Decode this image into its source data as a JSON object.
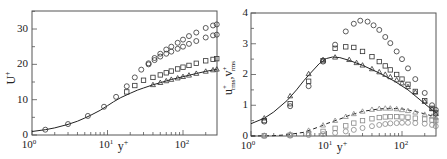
{
  "chart_data": [
    {
      "type": "scatter",
      "title": "",
      "xlabel": "y+",
      "ylabel": "U+",
      "xscale": "log",
      "xlim": [
        1,
        280
      ],
      "ylim": [
        0,
        35
      ],
      "xticks": [
        "10^0",
        "10^1",
        "10^2"
      ],
      "yticks": [
        0,
        10,
        20,
        30
      ],
      "grid": false,
      "series": [
        {
          "name": "reference line (solid)",
          "marker": "line",
          "x": [
            1,
            1.5,
            2,
            3,
            4,
            5,
            6,
            8,
            10,
            12,
            15,
            20,
            25,
            30,
            40,
            50,
            70,
            100,
            150,
            200,
            280
          ],
          "y": [
            1.0,
            1.5,
            2.0,
            3.0,
            3.9,
            4.8,
            5.6,
            7.0,
            8.3,
            9.4,
            10.6,
            11.8,
            12.7,
            13.3,
            14.2,
            14.8,
            15.7,
            16.5,
            17.4,
            18.0,
            18.6
          ]
        },
        {
          "name": "circles (upper)",
          "marker": "circle",
          "x": [
            1.5,
            3,
            5.5,
            9,
            13,
            18,
            23,
            28,
            35,
            42,
            50,
            60,
            70,
            85,
            100,
            120,
            150,
            200,
            250,
            280
          ],
          "y": [
            1.5,
            3.1,
            5.4,
            8.0,
            10.8,
            13.8,
            16.3,
            18.5,
            20.3,
            21.8,
            23.0,
            24.2,
            25.0,
            26.1,
            27.0,
            28.0,
            29.0,
            30.3,
            31.0,
            31.3
          ]
        },
        {
          "name": "circles (second)",
          "marker": "circle",
          "x": [
            35,
            42,
            50,
            60,
            70,
            85,
            100,
            120,
            150,
            200,
            250,
            280
          ],
          "y": [
            20.0,
            21.2,
            22.2,
            23.0,
            23.6,
            24.4,
            25.0,
            25.8,
            26.6,
            27.6,
            28.2,
            28.4
          ]
        },
        {
          "name": "squares",
          "marker": "square",
          "x": [
            18,
            23,
            30,
            40,
            50,
            60,
            70,
            85,
            100,
            120,
            150,
            200,
            250,
            280
          ],
          "y": [
            12.2,
            14.0,
            15.5,
            16.3,
            17.0,
            17.6,
            18.1,
            18.7,
            19.2,
            19.7,
            20.3,
            21.0,
            21.4,
            21.6
          ]
        },
        {
          "name": "triangles",
          "marker": "triangle",
          "x": [
            40,
            50,
            60,
            70,
            85,
            100,
            120,
            150,
            200,
            250,
            280
          ],
          "y": [
            14.2,
            14.8,
            15.3,
            15.7,
            16.1,
            16.5,
            16.9,
            17.4,
            18.0,
            18.4,
            18.6
          ]
        }
      ]
    },
    {
      "type": "scatter",
      "title": "",
      "xlabel": "y+",
      "ylabel": "u+rms, v+rms",
      "xscale": "log",
      "xlim": [
        1,
        280
      ],
      "ylim": [
        0,
        4
      ],
      "xticks": [
        "10^0",
        "10^1",
        "10^2"
      ],
      "yticks": [
        0,
        1,
        2,
        3,
        4
      ],
      "grid": false,
      "series": [
        {
          "name": "u_rms reference (solid)",
          "marker": "line",
          "x": [
            1,
            1.5,
            2,
            3,
            4,
            5,
            6,
            8,
            10,
            12,
            15,
            20,
            30,
            50,
            80,
            120,
            200,
            280
          ],
          "y": [
            0.4,
            0.58,
            0.78,
            1.15,
            1.5,
            1.8,
            2.02,
            2.35,
            2.52,
            2.57,
            2.55,
            2.46,
            2.3,
            2.05,
            1.78,
            1.5,
            1.05,
            0.75
          ]
        },
        {
          "name": "u_rms circles",
          "marker": "circle",
          "x": [
            1.5,
            3.3,
            5.8,
            9,
            13,
            18,
            23,
            28,
            35,
            42,
            50,
            60,
            70,
            85,
            100,
            120,
            150,
            200,
            250,
            280
          ],
          "y": [
            0.47,
            0.97,
            1.62,
            2.42,
            2.97,
            3.4,
            3.65,
            3.75,
            3.72,
            3.6,
            3.45,
            3.22,
            3.02,
            2.75,
            2.5,
            2.2,
            1.85,
            1.4,
            1.0,
            0.85
          ]
        },
        {
          "name": "u_rms squares",
          "marker": "square",
          "x": [
            1.5,
            3.3,
            5.8,
            9,
            13,
            18,
            23,
            30,
            40,
            50,
            60,
            70,
            85,
            100,
            120,
            150,
            200,
            250,
            280
          ],
          "y": [
            0.5,
            1.05,
            1.78,
            2.45,
            2.85,
            2.9,
            2.88,
            2.75,
            2.58,
            2.42,
            2.28,
            2.15,
            2.0,
            1.85,
            1.68,
            1.45,
            1.15,
            0.9,
            0.75
          ]
        },
        {
          "name": "u_rms triangles",
          "marker": "triangle",
          "x": [
            1.5,
            3.3,
            5.8,
            9,
            13,
            20,
            25,
            30,
            40,
            50,
            60,
            70,
            85,
            100,
            120,
            150,
            200,
            250,
            280
          ],
          "y": [
            0.58,
            1.3,
            2.02,
            2.48,
            2.56,
            2.48,
            2.38,
            2.3,
            2.18,
            2.08,
            2.0,
            1.92,
            1.82,
            1.72,
            1.6,
            1.42,
            1.12,
            0.88,
            0.72
          ]
        },
        {
          "name": "v_rms reference (dashed)",
          "marker": "dashed-line",
          "x": [
            1,
            2,
            3,
            5,
            8,
            10,
            15,
            20,
            30,
            50,
            70,
            100,
            150,
            200,
            280
          ],
          "y": [
            0.0,
            0.01,
            0.04,
            0.12,
            0.3,
            0.4,
            0.55,
            0.67,
            0.8,
            0.88,
            0.9,
            0.88,
            0.8,
            0.72,
            0.62
          ]
        },
        {
          "name": "v_rms triangles",
          "marker": "triangle",
          "x": [
            1.5,
            3.3,
            5.8,
            9,
            13,
            18,
            23,
            30,
            40,
            50,
            60,
            70,
            85,
            100,
            120,
            150,
            200,
            250,
            280
          ],
          "y": [
            0.02,
            0.06,
            0.18,
            0.35,
            0.5,
            0.63,
            0.72,
            0.8,
            0.86,
            0.89,
            0.9,
            0.9,
            0.88,
            0.85,
            0.82,
            0.77,
            0.7,
            0.64,
            0.6
          ]
        },
        {
          "name": "v_rms squares",
          "marker": "square",
          "x": [
            1.5,
            3.3,
            5.8,
            9,
            13,
            18,
            23,
            30,
            40,
            50,
            60,
            70,
            85,
            100,
            120,
            150,
            200,
            250,
            280
          ],
          "y": [
            0.01,
            0.03,
            0.08,
            0.15,
            0.25,
            0.33,
            0.42,
            0.5,
            0.56,
            0.6,
            0.62,
            0.63,
            0.63,
            0.62,
            0.61,
            0.58,
            0.55,
            0.52,
            0.5
          ]
        },
        {
          "name": "v_rms circles",
          "marker": "circle",
          "x": [
            1.5,
            3.3,
            5.8,
            9,
            13,
            18,
            23,
            30,
            40,
            50,
            60,
            70,
            85,
            100,
            120,
            150,
            200,
            250,
            280
          ],
          "y": [
            0.0,
            0.01,
            0.03,
            0.06,
            0.1,
            0.15,
            0.2,
            0.26,
            0.32,
            0.36,
            0.39,
            0.41,
            0.42,
            0.43,
            0.43,
            0.42,
            0.4,
            0.36,
            0.32
          ]
        }
      ]
    }
  ],
  "labels": {
    "left": {
      "ylabel": "U",
      "ylabel_sup": "+",
      "xlabel": "y",
      "xlabel_sup": "+",
      "yticks": [
        "0",
        "10",
        "20",
        "30"
      ],
      "xticks_base": [
        "10",
        "10",
        "10"
      ],
      "xticks_exp": [
        "0",
        "1",
        "2"
      ]
    },
    "right": {
      "ylabel_u": "u",
      "ylabel_u_sup": "+",
      "ylabel_u_sub": "rms",
      "ylabel_sep": ",",
      "ylabel_v": "v",
      "ylabel_v_sup": "+",
      "ylabel_v_sub": "rms",
      "xlabel": "y",
      "xlabel_sup": "+",
      "yticks": [
        "0",
        "1",
        "2",
        "3",
        "4"
      ],
      "xticks_base": [
        "10",
        "10",
        "10"
      ],
      "xticks_exp": [
        "0",
        "1",
        "2"
      ]
    }
  },
  "colors": {
    "axis": "#555555",
    "marker": "#333333",
    "faint_marker": "#888888",
    "line": "#222222"
  }
}
